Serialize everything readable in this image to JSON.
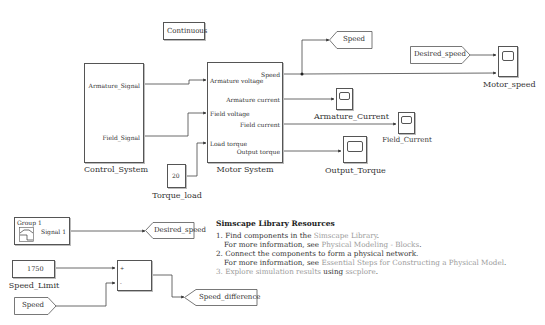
{
  "diagram": {
    "type": "simulink-model",
    "blocks": {
      "continuous": {
        "label": "Continuous"
      },
      "control_system": {
        "name": "Control_System",
        "ports_out": [
          "Armature_Signal",
          "Field_Signal"
        ]
      },
      "motor_system": {
        "name": "Motor System",
        "ports_in": [
          "Armature voltage",
          "Field voltage",
          "Load torque"
        ],
        "ports_out": [
          "Speed",
          "Armature current",
          "Field current",
          "Output torque"
        ]
      },
      "torque_load": {
        "name": "Torque_load",
        "value": "20"
      },
      "goto_speed": {
        "tag": "Speed"
      },
      "from_desired_speed": {
        "tag": "Desired_speed"
      },
      "scope_motor_speed": {
        "name": "Motor_speed"
      },
      "scope_armature_current": {
        "name": "Armature_Current"
      },
      "scope_field_current": {
        "name": "Field_Current"
      },
      "scope_output_torque": {
        "name": "Output_Torque"
      },
      "signal_builder": {
        "title": "Group 1",
        "port": "Signal 1"
      },
      "goto_desired_speed": {
        "tag": "Desired_speed"
      },
      "speed_limit": {
        "name": "Speed_Limit",
        "value": "1750"
      },
      "sum": {
        "signs": [
          "+",
          "-"
        ]
      },
      "from_speed": {
        "tag": "Speed"
      },
      "goto_speed_difference": {
        "tag": "Speed_difference"
      }
    },
    "annotation": {
      "title": "Simscape Library Resources",
      "items": [
        {
          "num": "1.",
          "text": "Find components in the ",
          "link": "Simscape Library",
          "tail": "."
        },
        {
          "num": "",
          "text": "For more information, see ",
          "link": "Physical Modeling - Blocks",
          "tail": "."
        },
        {
          "num": "2.",
          "text": "Connect the components to form a physical network.",
          "link": "",
          "tail": ""
        },
        {
          "num": "",
          "text": "For more information, see ",
          "link": "Essential Steps for Constructing a Physical Model",
          "tail": "."
        },
        {
          "num": "3.",
          "link_first": "Explore simulation results",
          "text": " using ",
          "link": "sscplore",
          "tail": "."
        }
      ]
    }
  }
}
